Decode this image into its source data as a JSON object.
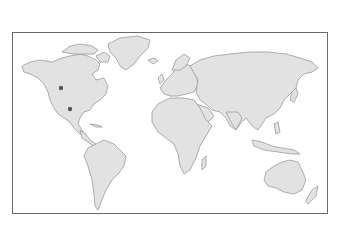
{
  "map": {
    "type": "world-map",
    "projection": "equirectangular-like",
    "land_color": "#e2e2e2",
    "coast_color": "#9a9a9a",
    "frame_color": "#6a6a6a",
    "markers": [
      {
        "id": "marker-1",
        "region": "central North America",
        "x": 61,
        "y": 88,
        "color": "#555555"
      },
      {
        "id": "marker-2",
        "region": "southern United States",
        "x": 70,
        "y": 109,
        "color": "#555555"
      }
    ]
  }
}
